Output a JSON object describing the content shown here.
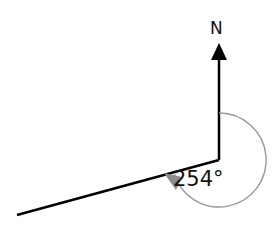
{
  "diagram": {
    "type": "bearing-diagram",
    "north_label": "N",
    "angle_label": "254°",
    "bearing_degrees": 254,
    "colors": {
      "lines": "#000000",
      "arc": "#999999",
      "arc_arrowhead": "#8c8c8c",
      "text": "#111111"
    }
  }
}
